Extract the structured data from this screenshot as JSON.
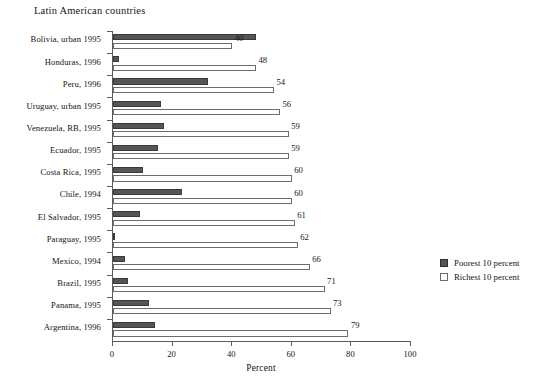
{
  "chart_data": {
    "type": "bar",
    "title": "Latin American countries",
    "xlabel": "Percent",
    "ylabel": "",
    "xlim": [
      0,
      100
    ],
    "xticks": [
      0,
      20,
      40,
      60,
      80,
      100
    ],
    "grid": false,
    "orientation": "horizontal",
    "legend_position": "right",
    "categories": [
      "Bolivia, urban 1995",
      "Honduras, 1996",
      "Peru, 1996",
      "Uruguay, urban 1995",
      "Venezuela, RB, 1995",
      "Ecuador, 1995",
      "Costa Rica, 1995",
      "Chile, 1994",
      "El Salvador, 1995",
      "Paraguay, 1995",
      "Mexico, 1994",
      "Brazil, 1995",
      "Panama, 1995",
      "Argentina, 1996"
    ],
    "series": [
      {
        "name": "Poorest 10 percent",
        "color": "#555555",
        "values": [
          48,
          2,
          32,
          16,
          17,
          15,
          10,
          23,
          9,
          0.5,
          4,
          5,
          12,
          14
        ],
        "labels": [
          "",
          "",
          "",
          "",
          "",
          "",
          "",
          "",
          "",
          "",
          "",
          "",
          "",
          ""
        ]
      },
      {
        "name": "Richest 10 percent",
        "color": "#ffffff",
        "values": [
          40,
          48,
          54,
          56,
          59,
          59,
          60,
          60,
          61,
          62,
          66,
          71,
          73,
          79
        ],
        "labels": [
          "40",
          "48",
          "54",
          "56",
          "59",
          "59",
          "60",
          "60",
          "61",
          "62",
          "66",
          "71",
          "73",
          "79"
        ]
      }
    ]
  },
  "legend": {
    "items": [
      {
        "label": "Poorest 10 percent"
      },
      {
        "label": "Richest 10 percent"
      }
    ]
  }
}
